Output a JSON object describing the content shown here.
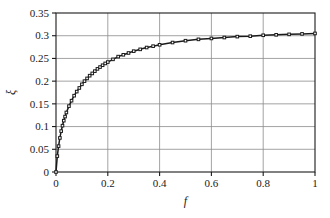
{
  "chart_data": {
    "type": "line",
    "title": "",
    "subtitle": "",
    "xlabel": "f",
    "ylabel": "ξ",
    "xlim": [
      0,
      1
    ],
    "ylim": [
      0,
      0.35
    ],
    "grid": true,
    "legend": null,
    "legend_position": "none",
    "marker": "square",
    "marker_color": "#1a1a1a",
    "line_color": "#1a1a1a",
    "grid_color": "#8c8c8c",
    "axis_color": "#1a1a1a",
    "background": "#ffffff",
    "xticks": [
      0,
      0.2,
      0.4,
      0.6,
      0.8,
      1
    ],
    "xtick_labels": [
      "0",
      "0.2",
      "0.4",
      "0.6",
      "0.8",
      "1"
    ],
    "yticks": [
      0,
      0.05,
      0.1,
      0.15,
      0.2,
      0.25,
      0.3,
      0.35
    ],
    "ytick_labels": [
      "0",
      "0.05",
      "0.1",
      "0.15",
      "0.2",
      "0.25",
      "0.3",
      "0.35"
    ],
    "x_gridlines": [
      0.2,
      0.4,
      0.6,
      0.8
    ],
    "y_gridlines": [
      0.05,
      0.1,
      0.15,
      0.2,
      0.25,
      0.3
    ],
    "series": [
      {
        "name": "xi vs f",
        "x": [
          0.0,
          0.005,
          0.01,
          0.015,
          0.02,
          0.025,
          0.03,
          0.035,
          0.04,
          0.05,
          0.06,
          0.07,
          0.08,
          0.09,
          0.1,
          0.11,
          0.12,
          0.13,
          0.14,
          0.15,
          0.16,
          0.17,
          0.18,
          0.19,
          0.2,
          0.22,
          0.24,
          0.26,
          0.28,
          0.3,
          0.325,
          0.35,
          0.375,
          0.4,
          0.45,
          0.5,
          0.55,
          0.6,
          0.65,
          0.7,
          0.75,
          0.8,
          0.85,
          0.9,
          0.95,
          1.0
        ],
        "y": [
          0.0,
          0.035,
          0.057,
          0.075,
          0.09,
          0.102,
          0.113,
          0.122,
          0.131,
          0.145,
          0.157,
          0.168,
          0.177,
          0.185,
          0.193,
          0.2,
          0.206,
          0.212,
          0.217,
          0.222,
          0.227,
          0.231,
          0.235,
          0.239,
          0.242,
          0.248,
          0.254,
          0.258,
          0.262,
          0.266,
          0.27,
          0.274,
          0.277,
          0.28,
          0.285,
          0.289,
          0.292,
          0.294,
          0.296,
          0.298,
          0.299,
          0.301,
          0.302,
          0.303,
          0.304,
          0.305
        ]
      }
    ]
  },
  "figure": {
    "caption": ""
  }
}
